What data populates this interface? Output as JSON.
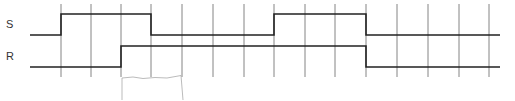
{
  "diagram": {
    "type": "timing-diagram",
    "width": 515,
    "height": 100,
    "colors": {
      "signal": "#222222",
      "grid": "#666666",
      "scribble": "#aaaaaa",
      "label": "#333333"
    },
    "grid": {
      "x_positions": [
        61,
        91,
        121,
        151,
        182,
        213,
        244,
        274,
        305,
        335,
        366,
        397,
        428,
        459,
        489
      ],
      "y_top": 4,
      "y_bottom": 77
    },
    "signals": [
      {
        "name": "S",
        "label_x": 6,
        "label_y": 18,
        "high_y": 14,
        "low_y": 35,
        "x_start": 30,
        "x_end": 500,
        "start_level": 0,
        "transitions": [
          61,
          151,
          274,
          366
        ],
        "levels": [
          "low",
          "high",
          "low",
          "high",
          "low"
        ]
      },
      {
        "name": "R",
        "label_x": 6,
        "label_y": 50,
        "high_y": 46,
        "low_y": 67,
        "x_start": 30,
        "x_end": 500,
        "start_level": 0,
        "transitions": [
          121,
          366
        ],
        "levels": [
          "low",
          "high",
          "low"
        ]
      }
    ],
    "annotation": {
      "description": "faint hand-drawn sketch box below R signal",
      "x1": 121,
      "x2": 182,
      "y_top": 77,
      "y_bottom": 100
    }
  }
}
